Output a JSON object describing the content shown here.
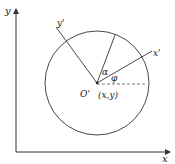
{
  "diagram": {
    "axes": {
      "x_label": "x",
      "y_label": "y"
    },
    "rotated_axes": {
      "x_label": "x'",
      "y_label": "y'"
    },
    "center": {
      "name_label": "O'",
      "coord_label": "(x,y)"
    },
    "angles": {
      "alpha_label": "α",
      "phi_label": "φ"
    },
    "colors": {
      "stroke": "#333333",
      "background": "#ffffff"
    }
  }
}
